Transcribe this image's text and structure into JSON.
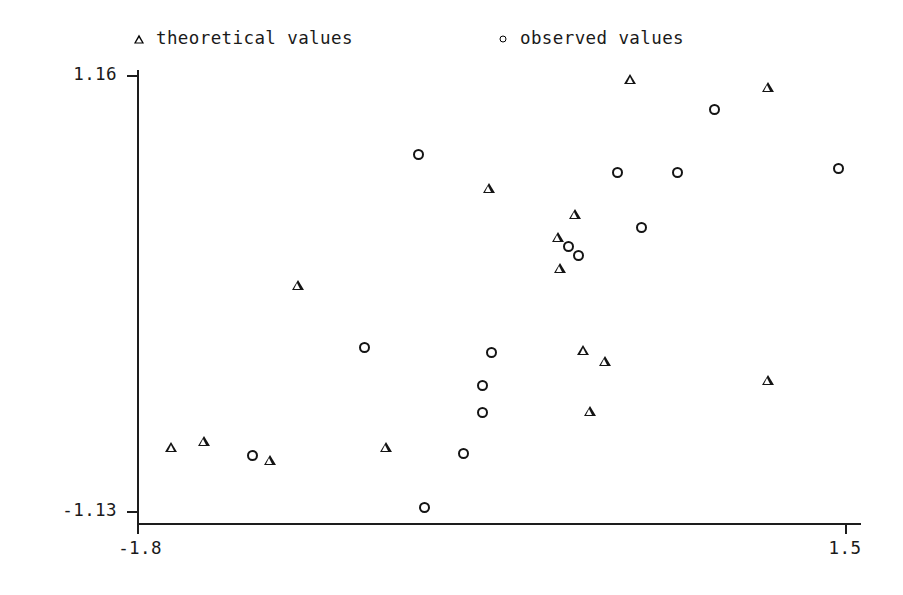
{
  "chart_data": {
    "type": "scatter",
    "title": "",
    "xlabel": "",
    "ylabel": "",
    "xlim": [
      -1.8,
      1.5
    ],
    "ylim": [
      -1.13,
      1.16
    ],
    "xticks": [
      "-1.8",
      "1.5"
    ],
    "yticks": [
      "1.16",
      "-1.13"
    ],
    "xtick_values": [
      -1.8,
      1.5
    ],
    "ytick_values": [
      1.16,
      -1.13
    ],
    "grid": false,
    "legend_position": "above-plot",
    "series": [
      {
        "name": "theoretical values",
        "marker": "triangle",
        "color": "#141414",
        "points": [
          {
            "x": -1.64,
            "y": -0.8
          },
          {
            "x": -1.49,
            "y": -0.77
          },
          {
            "x": -1.18,
            "y": -0.87
          },
          {
            "x": -1.05,
            "y": 0.05
          },
          {
            "x": -0.64,
            "y": -0.8
          },
          {
            "x": -0.16,
            "y": 0.56
          },
          {
            "x": 0.16,
            "y": 0.3
          },
          {
            "x": 0.24,
            "y": 0.42
          },
          {
            "x": 0.17,
            "y": 0.14
          },
          {
            "x": 0.28,
            "y": -0.29
          },
          {
            "x": 0.38,
            "y": -0.35
          },
          {
            "x": 0.31,
            "y": -0.61
          },
          {
            "x": 0.5,
            "y": 1.13
          },
          {
            "x": 1.14,
            "y": -0.45
          },
          {
            "x": 1.14,
            "y": 1.09
          }
        ]
      },
      {
        "name": "observed values",
        "marker": "circle",
        "color": "#141414",
        "points": [
          {
            "x": -1.26,
            "y": -0.84
          },
          {
            "x": -0.74,
            "y": -0.27
          },
          {
            "x": -0.46,
            "y": -1.11
          },
          {
            "x": -0.28,
            "y": -0.83
          },
          {
            "x": -0.49,
            "y": 0.74
          },
          {
            "x": -0.15,
            "y": -0.3
          },
          {
            "x": -0.19,
            "y": -0.47
          },
          {
            "x": -0.19,
            "y": -0.61
          },
          {
            "x": 0.21,
            "y": 0.26
          },
          {
            "x": 0.26,
            "y": 0.21
          },
          {
            "x": 0.44,
            "y": 0.65
          },
          {
            "x": 0.55,
            "y": 0.36
          },
          {
            "x": 0.72,
            "y": 0.65
          },
          {
            "x": 0.89,
            "y": 0.98
          },
          {
            "x": 1.47,
            "y": 0.67
          }
        ]
      }
    ]
  },
  "legend": {
    "theoretical_label": "theoretical values",
    "observed_label": "observed values",
    "theoretical_marker": "triangle-icon",
    "observed_marker": "circle-icon"
  },
  "axes": {
    "y_top_label": "1.16",
    "y_bottom_label": "-1.13",
    "x_left_label": "-1.8",
    "x_right_label": "1.5"
  }
}
